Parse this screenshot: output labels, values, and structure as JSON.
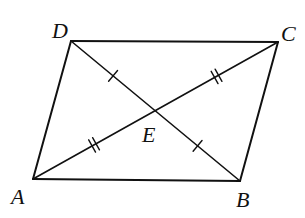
{
  "figure": {
    "type": "parallelogram-with-diagonals",
    "stroke_color": "#111111",
    "background_color": "#ffffff",
    "vertices": [
      {
        "id": "A",
        "label": "A"
      },
      {
        "id": "B",
        "label": "B"
      },
      {
        "id": "C",
        "label": "C"
      },
      {
        "id": "D",
        "label": "D"
      }
    ],
    "intersection": {
      "id": "E",
      "label": "E"
    },
    "sides": [
      "AB",
      "BC",
      "CD",
      "DA"
    ],
    "diagonals": [
      "AC",
      "BD"
    ],
    "congruence_marks": [
      {
        "segment": "DE",
        "ticks": 1
      },
      {
        "segment": "EB",
        "ticks": 1
      },
      {
        "segment": "AE",
        "ticks": 2
      },
      {
        "segment": "EC",
        "ticks": 2
      }
    ]
  }
}
